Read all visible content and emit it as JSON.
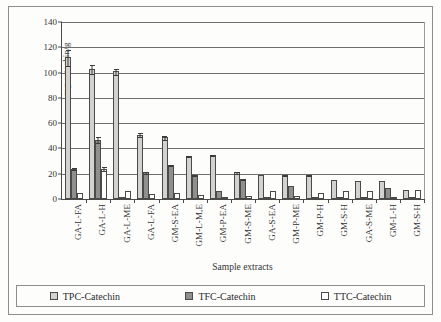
{
  "chart_data": {
    "type": "bar",
    "title": "",
    "xlabel": "Sample extracts",
    "ylabel": "mg catechin/g",
    "ylim": [
      0,
      140
    ],
    "ytick_step": 20,
    "yticks": [
      0,
      20,
      40,
      60,
      80,
      100,
      120,
      140
    ],
    "grid": true,
    "legend_position": "bottom",
    "categories": [
      "GA-L-FA",
      "GA-L-H",
      "GA-L-ME",
      "GA-L-FA",
      "GM-S-EA",
      "GM-L-M,E",
      "GM-P-EA",
      "GM-S-ME",
      "GA-S-EA",
      "GM-P-ME",
      "GM-P-H",
      "GM-S-H",
      "GA-S-ME",
      "GM-L-H",
      "GM-S-H"
    ],
    "series": [
      {
        "name": "TPC-Catechin",
        "color": "#d4d2cf",
        "values": [
          112,
          103,
          101,
          51,
          49,
          34,
          35,
          21,
          19,
          19,
          19,
          15,
          14,
          14,
          7
        ],
        "errors": [
          7,
          4,
          3,
          2,
          2,
          1,
          1,
          1,
          0,
          1,
          1,
          0,
          0,
          0,
          0
        ]
      },
      {
        "name": "TFC-Catechin",
        "color": "#8f8f8d",
        "values": [
          24,
          47,
          1,
          21,
          27,
          19,
          6,
          16,
          0,
          10,
          0,
          0,
          1,
          9,
          0
        ],
        "errors": [
          1,
          3,
          0,
          1,
          1,
          1,
          0,
          1,
          0,
          0,
          0,
          0,
          0,
          0,
          0
        ]
      },
      {
        "name": "TTC-Catechin",
        "color": "#ffffff",
        "values": [
          5,
          24,
          6,
          4,
          5,
          3,
          1,
          2,
          6,
          2,
          5,
          6,
          6,
          1,
          7
        ],
        "errors": [
          0,
          2,
          0,
          0,
          0,
          0,
          0,
          0,
          0,
          0,
          0,
          0,
          0,
          0,
          0
        ]
      }
    ]
  },
  "legend": {
    "items": [
      {
        "label": "TPC-Catechin",
        "swatch": "tpc"
      },
      {
        "label": "TFC-Catechin",
        "swatch": "tfc"
      },
      {
        "label": "TTC-Catechin",
        "swatch": "ttc"
      }
    ]
  }
}
